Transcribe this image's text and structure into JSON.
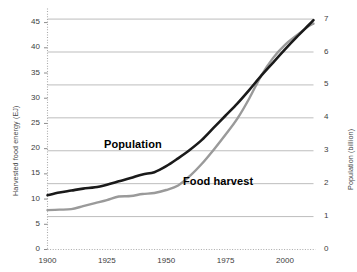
{
  "chart_data": {
    "type": "line",
    "title": "",
    "subtitle": "",
    "xlabel": "",
    "ylabel": "Harvested food energy (EJ)",
    "y2label": "Population (billion)",
    "xlim": [
      1900,
      2012
    ],
    "ylim": [
      0,
      47
    ],
    "y2lim": [
      0,
      7.2
    ],
    "grid": true,
    "grid_axis": "y2",
    "legend_position": "inline-annotations",
    "xticks": [
      1900,
      1925,
      1950,
      1975,
      2000
    ],
    "xtick_labels": [
      "1900",
      "1925",
      "1950",
      "1975",
      "2000"
    ],
    "yticks": [
      0,
      5,
      10,
      15,
      20,
      25,
      30,
      35,
      40,
      45
    ],
    "ytick_labels": [
      "0",
      "5",
      "10",
      "15",
      "20",
      "25",
      "30",
      "35",
      "40",
      "45"
    ],
    "y2ticks": [
      0,
      1,
      2,
      3,
      4,
      5,
      6,
      7
    ],
    "y2tick_labels": [
      "0",
      "1",
      "2",
      "3",
      "4",
      "5",
      "6",
      "7"
    ],
    "series": [
      {
        "name": "Population",
        "axis": "right",
        "units": "billion",
        "color": "#1a1a1a",
        "line_width": 2.6,
        "x": [
          1900,
          1905,
          1910,
          1915,
          1920,
          1925,
          1930,
          1935,
          1940,
          1945,
          1950,
          1955,
          1960,
          1965,
          1970,
          1975,
          1980,
          1985,
          1990,
          1995,
          2000,
          2005,
          2010,
          2012
        ],
        "values": [
          1.65,
          1.73,
          1.79,
          1.85,
          1.89,
          1.97,
          2.07,
          2.17,
          2.28,
          2.35,
          2.53,
          2.77,
          3.03,
          3.33,
          3.7,
          4.07,
          4.44,
          4.85,
          5.28,
          5.68,
          6.08,
          6.46,
          6.82,
          6.97
        ]
      },
      {
        "name": "Food harvest",
        "axis": "left",
        "units": "EJ",
        "color": "#9a9a9a",
        "line_width": 2.4,
        "x": [
          1900,
          1905,
          1910,
          1915,
          1920,
          1925,
          1930,
          1935,
          1940,
          1945,
          1950,
          1955,
          1960,
          1965,
          1970,
          1975,
          1980,
          1985,
          1990,
          1995,
          2000,
          2005,
          2010,
          2012
        ],
        "values": [
          7.8,
          7.9,
          8.0,
          8.6,
          9.2,
          9.8,
          10.5,
          10.6,
          11.0,
          11.2,
          11.8,
          12.7,
          14.6,
          17.0,
          19.8,
          22.8,
          26.0,
          30.0,
          34.5,
          38.0,
          40.6,
          42.5,
          44.3,
          44.8
        ]
      }
    ],
    "annotations": [
      {
        "text": "Population",
        "series": "Population"
      },
      {
        "text": "Food harvest",
        "series": "Food harvest"
      }
    ]
  },
  "axes": {
    "left_title": "Harvested food energy (EJ)",
    "right_title": "Population (billion)"
  },
  "labels": {
    "population": "Population",
    "food_harvest": "Food harvest"
  },
  "colors": {
    "population_line": "#1a1a1a",
    "food_line": "#9a9a9a",
    "gridline": "#b5b5b5",
    "axis_dotted": "#aaaaaa",
    "text": "#3d3d3d",
    "background": "#ffffff"
  }
}
